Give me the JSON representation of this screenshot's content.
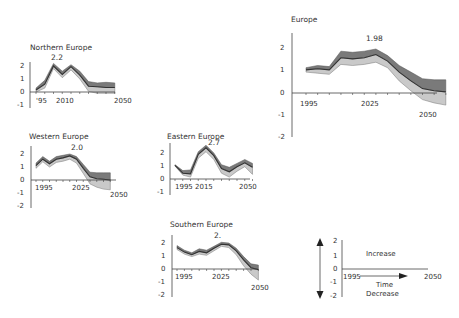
{
  "chart_data": [
    {
      "type": "area",
      "title": "Europe",
      "peak_label": "1.98",
      "x_tick_labels": [
        "1995",
        "2025",
        "2050"
      ],
      "y_tick_labels": [
        "2",
        "1",
        "0",
        "-1",
        "-2"
      ],
      "ylim": [
        -2,
        2.5
      ],
      "x": [
        1992,
        1997,
        2002,
        2007,
        2012,
        2017,
        2022,
        2027,
        2032,
        2037,
        2042,
        2047,
        2052
      ],
      "series": [
        {
          "name": "upper",
          "values": [
            1.15,
            1.25,
            1.2,
            1.9,
            1.85,
            1.9,
            2.0,
            1.7,
            1.25,
            0.95,
            0.65,
            0.6,
            0.6
          ]
        },
        {
          "name": "median",
          "values": [
            1.05,
            1.1,
            1.05,
            1.6,
            1.55,
            1.6,
            1.75,
            1.45,
            0.95,
            0.55,
            0.2,
            0.1,
            0.05
          ]
        },
        {
          "name": "lower",
          "values": [
            0.95,
            0.9,
            0.85,
            1.3,
            1.25,
            1.3,
            1.4,
            1.15,
            0.55,
            0.1,
            -0.3,
            -0.45,
            -0.55
          ]
        }
      ]
    },
    {
      "type": "area",
      "title": "Northern Europe",
      "peak_label": "2.2",
      "x_tick_labels": [
        "'95",
        "2010",
        "2050"
      ],
      "y_tick_labels": [
        "2",
        "1",
        "0",
        "-1"
      ],
      "x": [
        1992,
        1997,
        2002,
        2007,
        2012,
        2017,
        2022,
        2027,
        2032,
        2037
      ],
      "series": [
        {
          "name": "upper",
          "values": [
            0.3,
            0.9,
            2.2,
            1.6,
            2.1,
            1.6,
            0.8,
            0.7,
            0.75,
            0.7
          ]
        },
        {
          "name": "median",
          "values": [
            0.15,
            0.6,
            2.0,
            1.35,
            1.95,
            1.3,
            0.45,
            0.4,
            0.35,
            0.35
          ]
        },
        {
          "name": "lower",
          "values": [
            0.0,
            0.3,
            1.8,
            1.1,
            1.7,
            1.0,
            0.05,
            -0.1,
            -0.1,
            -0.1
          ]
        }
      ]
    },
    {
      "type": "area",
      "title": "Western Europe",
      "peak_label": "2.0",
      "x_tick_labels": [
        "1995",
        "2025",
        "2050"
      ],
      "y_tick_labels": [
        "2",
        "1",
        "0",
        "-1",
        "-2"
      ],
      "x": [
        1992,
        1997,
        2002,
        2007,
        2012,
        2017,
        2022,
        2027,
        2032,
        2037,
        2042,
        2047
      ],
      "series": [
        {
          "name": "upper",
          "values": [
            1.3,
            1.8,
            1.45,
            1.8,
            1.9,
            2.0,
            1.8,
            1.2,
            0.6,
            0.55,
            0.55,
            0.55
          ]
        },
        {
          "name": "median",
          "values": [
            1.1,
            1.6,
            1.25,
            1.6,
            1.7,
            1.85,
            1.6,
            0.9,
            0.25,
            0.1,
            0.05,
            0.0
          ]
        },
        {
          "name": "lower",
          "values": [
            0.9,
            1.4,
            1.0,
            1.35,
            1.45,
            1.6,
            1.3,
            0.5,
            -0.3,
            -0.55,
            -0.7,
            -0.75
          ]
        }
      ]
    },
    {
      "type": "area",
      "title": "Eastern Europe",
      "peak_label": "2.7",
      "x_tick_labels": [
        "1995",
        "2015",
        "2050"
      ],
      "y_tick_labels": [
        "2",
        "1",
        "0",
        "-1"
      ],
      "x": [
        1990,
        1995,
        2000,
        2005,
        2010,
        2015,
        2020,
        2025,
        2030,
        2035,
        2040
      ],
      "series": [
        {
          "name": "upper",
          "values": [
            1.1,
            0.65,
            0.7,
            2.1,
            2.6,
            2.0,
            1.1,
            0.9,
            1.2,
            1.5,
            1.2
          ]
        },
        {
          "name": "median",
          "values": [
            1.05,
            0.45,
            0.4,
            1.9,
            2.4,
            1.8,
            0.8,
            0.55,
            0.95,
            1.25,
            0.9
          ]
        },
        {
          "name": "lower",
          "values": [
            1.0,
            0.3,
            0.15,
            1.6,
            2.1,
            1.5,
            0.45,
            0.15,
            0.6,
            0.95,
            0.35
          ]
        }
      ]
    },
    {
      "type": "area",
      "title": "Southern Europe",
      "peak_label": "2.",
      "x_tick_labels": [
        "1995",
        "2025",
        "2050"
      ],
      "y_tick_labels": [
        "2",
        "1",
        "0",
        "-1",
        "-2"
      ],
      "x": [
        1990,
        1995,
        2000,
        2005,
        2010,
        2015,
        2020,
        2025,
        2030,
        2035,
        2040,
        2045
      ],
      "series": [
        {
          "name": "upper",
          "values": [
            1.8,
            1.45,
            1.25,
            1.55,
            1.45,
            1.75,
            2.05,
            2.0,
            1.6,
            0.95,
            0.4,
            0.3
          ]
        },
        {
          "name": "median",
          "values": [
            1.65,
            1.3,
            1.1,
            1.35,
            1.25,
            1.6,
            1.9,
            1.85,
            1.4,
            0.7,
            0.1,
            -0.05
          ]
        },
        {
          "name": "lower",
          "values": [
            1.5,
            1.15,
            0.95,
            1.15,
            1.05,
            1.4,
            1.75,
            1.65,
            1.1,
            0.25,
            -0.4,
            -0.85
          ]
        }
      ]
    }
  ],
  "legend_key": {
    "y_tick_labels": [
      "2",
      "1",
      "0",
      "-1",
      "-2"
    ],
    "start_label": "1995",
    "end_label": "2050",
    "time_label": "Time",
    "increase_label": "Increase",
    "decrease_label": "Decrease"
  },
  "colors": {
    "outer_band": "#7a7a7a",
    "inner_band": "#c9c9c9",
    "median_line": "#333333",
    "axis": "#444444"
  }
}
